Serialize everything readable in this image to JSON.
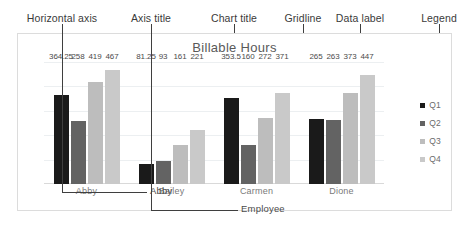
{
  "annotations": {
    "items": [
      {
        "label": "Horizontal axis",
        "x": 62,
        "line_top": 24,
        "line_bottom": 33,
        "arrow": false
      },
      {
        "label": "Axis title",
        "x": 151,
        "line_top": 24,
        "line_bottom": 33,
        "arrow": false
      },
      {
        "label": "Chart title",
        "x": 234,
        "line_top": 24,
        "line_bottom": 44,
        "arrow": false
      },
      {
        "label": "Gridline",
        "x": 303,
        "line_top": 24,
        "line_bottom": 88,
        "arrow": false
      },
      {
        "label": "Data label",
        "x": 360,
        "line_top": 24,
        "line_bottom": 118,
        "arrow": false
      },
      {
        "label": "Legend",
        "x": 439,
        "line_top": 24,
        "line_bottom": 112,
        "arrow": true
      }
    ]
  },
  "leaders": {
    "horizontal_axis": {
      "target_text": "Abby"
    },
    "axis_title": {
      "target_text": "Employee"
    }
  },
  "chart_data": {
    "type": "bar",
    "title": "Billable Hours",
    "xlabel": "Employee",
    "ylabel": "",
    "categories": [
      "Abby",
      "Bailey",
      "Carmen",
      "Dione"
    ],
    "series": [
      {
        "name": "Q1",
        "color": "#1a1a1a",
        "values": [
          364.25,
          81.25,
          353.5,
          265
        ]
      },
      {
        "name": "Q2",
        "color": "#636363",
        "values": [
          258,
          93,
          160,
          263
        ]
      },
      {
        "name": "Q3",
        "color": "#bdbdbd",
        "values": [
          419,
          161,
          272,
          373
        ]
      },
      {
        "name": "Q4",
        "color": "#c9c9c9",
        "values": [
          467,
          221,
          371,
          447
        ]
      }
    ],
    "ylim": [
      0,
      500
    ],
    "gridlines": [
      100,
      200,
      300,
      400,
      500
    ],
    "grid": true,
    "legend_position": "right",
    "legend_entries": [
      "Q1",
      "Q2",
      "Q3",
      "Q4"
    ]
  }
}
